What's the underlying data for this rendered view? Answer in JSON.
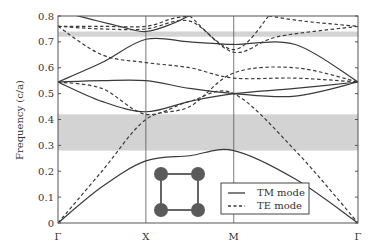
{
  "chart_data": {
    "type": "line",
    "title": "",
    "xlabel": "",
    "ylabel": "Frequency (c/a)",
    "ylim": [
      0,
      0.8
    ],
    "yticks": [
      "0",
      "0.1",
      "0.2",
      "0.3",
      "0.4",
      "0.5",
      "0.6",
      "0.7",
      "0.8"
    ],
    "xticks": [
      {
        "label": "Γ",
        "k": 0
      },
      {
        "label": "X",
        "k": 1
      },
      {
        "label": "M",
        "k": 2
      },
      {
        "label": "Γ",
        "k": 3.414
      }
    ],
    "grid": false,
    "legend_position": "lower-right",
    "band_gaps": [
      {
        "from": 0.28,
        "to": 0.42,
        "color": "#d3d3d3"
      },
      {
        "from": 0.72,
        "to": 0.74,
        "color": "#d3d3d3"
      }
    ],
    "inset": "square lattice of 4 circular rods",
    "series": [
      {
        "name": "TM mode",
        "style": "solid",
        "bands": [
          [
            [
              0,
              0
            ],
            [
              0.5,
              0.14
            ],
            [
              1,
              0.24
            ],
            [
              1.5,
              0.26
            ],
            [
              2,
              0.28
            ],
            [
              2.7,
              0.17
            ],
            [
              3.414,
              0
            ]
          ],
          [
            [
              0,
              0.545
            ],
            [
              0.5,
              0.47
            ],
            [
              1,
              0.43
            ],
            [
              1.5,
              0.47
            ],
            [
              2,
              0.5
            ],
            [
              2.7,
              0.52
            ],
            [
              3.414,
              0.545
            ]
          ],
          [
            [
              0,
              0.545
            ],
            [
              0.5,
              0.55
            ],
            [
              1,
              0.55
            ],
            [
              1.5,
              0.52
            ],
            [
              2,
              0.5
            ],
            [
              2.7,
              0.49
            ],
            [
              3.414,
              0.545
            ]
          ],
          [
            [
              0,
              0.545
            ],
            [
              0.5,
              0.62
            ],
            [
              1,
              0.71
            ],
            [
              1.5,
              0.7
            ],
            [
              2,
              0.69
            ],
            [
              2.7,
              0.69
            ],
            [
              3.414,
              0.545
            ]
          ],
          [
            [
              0,
              0.82
            ],
            [
              0.7,
              0.76
            ],
            [
              1,
              0.74
            ],
            [
              1.3,
              0.77
            ],
            [
              1.6,
              0.82
            ]
          ]
        ]
      },
      {
        "name": "TE mode",
        "style": "dashed",
        "bands": [
          [
            [
              0,
              0
            ],
            [
              0.5,
              0.2
            ],
            [
              1,
              0.4
            ],
            [
              1.5,
              0.45
            ],
            [
              2,
              0.58
            ],
            [
              2.7,
              0.6
            ],
            [
              3.414,
              0.545
            ]
          ],
          [
            [
              0,
              0.545
            ],
            [
              0.5,
              0.52
            ],
            [
              1,
              0.42
            ],
            [
              1.5,
              0.47
            ],
            [
              2,
              0.5
            ],
            [
              2.7,
              0.28
            ],
            [
              3.414,
              0
            ]
          ],
          [
            [
              0,
              0.76
            ],
            [
              0.5,
              0.65
            ],
            [
              1,
              0.62
            ],
            [
              1.5,
              0.6
            ],
            [
              2,
              0.56
            ],
            [
              2.7,
              0.56
            ],
            [
              3.414,
              0.545
            ]
          ],
          [
            [
              0,
              0.76
            ],
            [
              0.5,
              0.75
            ],
            [
              1,
              0.75
            ],
            [
              1.5,
              0.78
            ],
            [
              2,
              0.66
            ],
            [
              2.5,
              0.72
            ],
            [
              3.414,
              0.76
            ]
          ],
          [
            [
              0,
              0.76
            ],
            [
              0.5,
              0.76
            ],
            [
              1,
              0.76
            ],
            [
              1.3,
              0.79
            ],
            [
              1.5,
              0.8
            ]
          ],
          [
            [
              1.5,
              0.8
            ],
            [
              2,
              0.67
            ],
            [
              2.4,
              0.8
            ]
          ],
          [
            [
              2.4,
              0.8
            ],
            [
              2.8,
              0.78
            ],
            [
              3.414,
              0.76
            ]
          ]
        ]
      }
    ]
  },
  "legend": {
    "items": [
      {
        "label": "TM mode",
        "style": "solid"
      },
      {
        "label": "TE mode",
        "style": "dashed"
      }
    ]
  },
  "axes": {
    "ylabel": "Frequency (c/a)"
  },
  "colors": {
    "line": "#3a3a3a",
    "gap": "#d3d3d3",
    "rod": "#5a5a5a",
    "axis": "#444444"
  }
}
